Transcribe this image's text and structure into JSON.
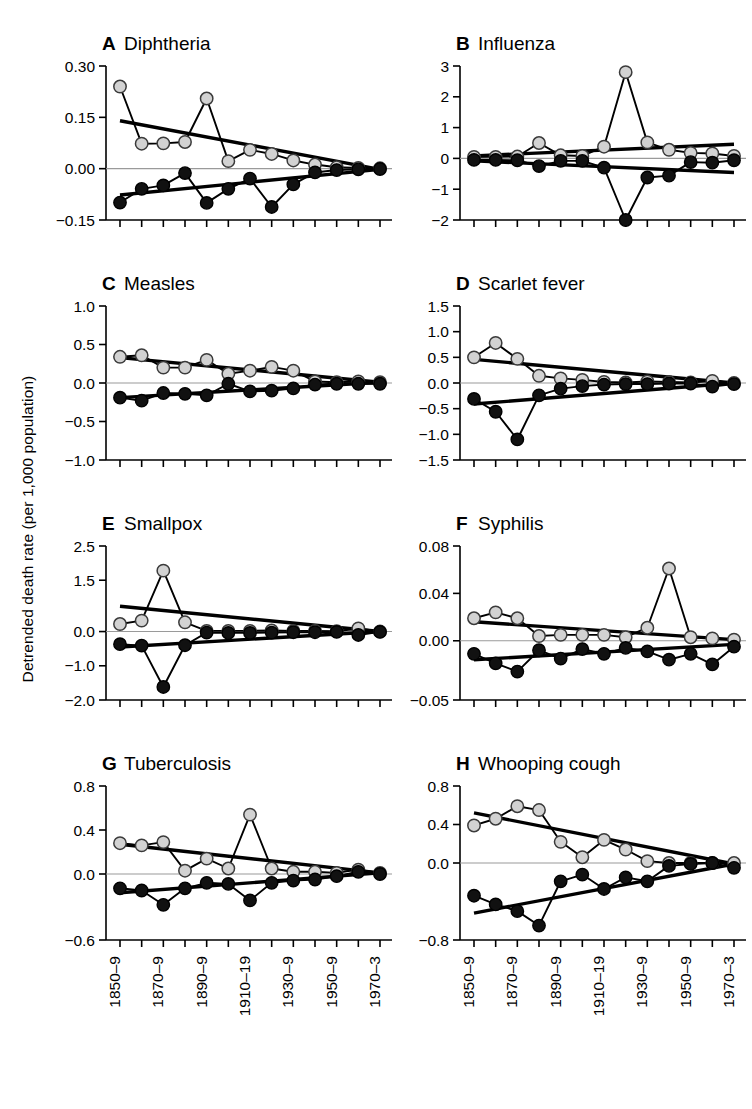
{
  "figure": {
    "y_axis_title": "Detrended death rate (per 1,000 population)",
    "x_tick_labels": [
      "1850–9",
      "1870–9",
      "1890–9",
      "1910–19",
      "1930–9",
      "1950–9",
      "1970–3"
    ],
    "colors": {
      "light_marker": "#d2d2d2",
      "dark_marker": "#111111",
      "line": "#000000",
      "zero_line": "#9a9a9a"
    },
    "n_points": 13,
    "series_names": [
      "upper",
      "lower"
    ]
  },
  "chart_data": [
    {
      "type": "line",
      "panel": "A",
      "title": "Diphtheria",
      "xlabel": "",
      "ylabel": "Detrended death rate (per 1,000 population)",
      "ylim": [
        -0.15,
        0.3
      ],
      "yticks": [
        0.3,
        0.15,
        0.0,
        -0.15
      ],
      "ytick_labels": [
        "0.30",
        "0.15",
        "0.00",
        "-0.15"
      ],
      "grid": false,
      "legend": "none",
      "x": [
        "1850–9",
        "1860–9",
        "1870–9",
        "1880–9",
        "1890–9",
        "1900–9",
        "1910–19",
        "1920–9",
        "1930–9",
        "1940–9",
        "1950–9",
        "1960–9",
        "1970–3"
      ],
      "series": [
        {
          "name": "upper",
          "marker": "light",
          "values": [
            0.24,
            0.073,
            0.074,
            0.078,
            0.205,
            0.022,
            0.055,
            0.043,
            0.024,
            0.012,
            0.004,
            0.002,
            0.001
          ]
        },
        {
          "name": "lower",
          "marker": "dark",
          "values": [
            -0.099,
            -0.059,
            -0.049,
            -0.013,
            -0.1,
            -0.059,
            -0.029,
            -0.112,
            -0.046,
            -0.011,
            -0.004,
            -0.002,
            -0.001
          ]
        }
      ],
      "trends": [
        {
          "name": "upper_trend",
          "y_start": 0.14,
          "y_end": -0.002
        },
        {
          "name": "lower_trend",
          "y_start": -0.077,
          "y_end": -0.002
        }
      ]
    },
    {
      "type": "line",
      "panel": "B",
      "title": "Influenza",
      "xlabel": "",
      "ylabel": "",
      "ylim": [
        -2,
        3
      ],
      "yticks": [
        3,
        2,
        1,
        0,
        -1,
        -2
      ],
      "ytick_labels": [
        "3",
        "2",
        "1",
        "0",
        "-1",
        "-2"
      ],
      "grid": false,
      "legend": "none",
      "x": [
        "1850–9",
        "1860–9",
        "1870–9",
        "1880–9",
        "1890–9",
        "1900–9",
        "1910–19",
        "1920–9",
        "1930–9",
        "1940–9",
        "1950–9",
        "1960–9",
        "1970–3"
      ],
      "series": [
        {
          "name": "upper",
          "marker": "light",
          "values": [
            0.05,
            0.05,
            0.06,
            0.5,
            0.1,
            0.08,
            0.38,
            2.8,
            0.52,
            0.28,
            0.18,
            0.16,
            0.08
          ]
        },
        {
          "name": "lower",
          "marker": "dark",
          "values": [
            -0.05,
            -0.05,
            -0.06,
            -0.25,
            -0.08,
            -0.08,
            -0.3,
            -2.0,
            -0.62,
            -0.56,
            -0.12,
            -0.14,
            -0.06
          ]
        }
      ],
      "trends": [
        {
          "name": "upper_trend",
          "y_start": 0.08,
          "y_end": 0.46
        },
        {
          "name": "lower_trend",
          "y_start": -0.08,
          "y_end": -0.46
        }
      ]
    },
    {
      "type": "line",
      "panel": "C",
      "title": "Measles",
      "xlabel": "",
      "ylabel": "",
      "ylim": [
        -1.0,
        1.0
      ],
      "yticks": [
        1.0,
        0.5,
        0.0,
        -0.5,
        -1.0
      ],
      "ytick_labels": [
        "1.0",
        "0.5",
        "0.0",
        "-0.5",
        "-1.0"
      ],
      "grid": false,
      "legend": "none",
      "x": [
        "1850–9",
        "1860–9",
        "1870–9",
        "1880–9",
        "1890–9",
        "1900–9",
        "1910–19",
        "1920–9",
        "1930–9",
        "1940–9",
        "1950–9",
        "1960–9",
        "1970–3"
      ],
      "series": [
        {
          "name": "upper",
          "marker": "light",
          "values": [
            0.34,
            0.36,
            0.2,
            0.2,
            0.3,
            0.12,
            0.16,
            0.21,
            0.16,
            0.02,
            0.01,
            0.02,
            0.01
          ]
        },
        {
          "name": "lower",
          "marker": "dark",
          "values": [
            -0.19,
            -0.23,
            -0.13,
            -0.14,
            -0.16,
            -0.01,
            -0.11,
            -0.1,
            -0.07,
            -0.02,
            -0.01,
            -0.01,
            -0.01
          ]
        }
      ],
      "trends": [
        {
          "name": "upper_trend",
          "y_start": 0.33,
          "y_end": 0.01
        },
        {
          "name": "lower_trend",
          "y_start": -0.19,
          "y_end": 0.01
        }
      ]
    },
    {
      "type": "line",
      "panel": "D",
      "title": "Scarlet fever",
      "xlabel": "",
      "ylabel": "",
      "ylim": [
        -1.5,
        1.5
      ],
      "yticks": [
        1.5,
        1.0,
        0.5,
        0.0,
        -0.5,
        -1.0,
        -1.5
      ],
      "ytick_labels": [
        "1.5",
        "1.0",
        "0.5",
        "0.0",
        "-0.5",
        "-1.0",
        "-1.5"
      ],
      "grid": false,
      "legend": "none",
      "x": [
        "1850–9",
        "1860–9",
        "1870–9",
        "1880–9",
        "1890–9",
        "1900–9",
        "1910–19",
        "1920–9",
        "1930–9",
        "1940–9",
        "1950–9",
        "1960–9",
        "1970–3"
      ],
      "series": [
        {
          "name": "upper",
          "marker": "light",
          "values": [
            0.5,
            0.78,
            0.47,
            0.14,
            0.09,
            0.06,
            0.02,
            0.01,
            0.03,
            0.02,
            0.01,
            0.04,
            0.0
          ]
        },
        {
          "name": "lower",
          "marker": "dark",
          "values": [
            -0.31,
            -0.56,
            -1.1,
            -0.24,
            -0.11,
            -0.06,
            -0.03,
            -0.02,
            -0.02,
            -0.01,
            -0.01,
            -0.07,
            -0.02
          ]
        }
      ],
      "trends": [
        {
          "name": "upper_trend",
          "y_start": 0.46,
          "y_end": 0.0
        },
        {
          "name": "lower_trend",
          "y_start": -0.41,
          "y_end": 0.0
        }
      ]
    },
    {
      "type": "line",
      "panel": "E",
      "title": "Smallpox",
      "xlabel": "",
      "ylabel": "",
      "ylim": [
        -2.0,
        2.5
      ],
      "yticks": [
        2.5,
        1.5,
        0.0,
        -1.0,
        -2.0
      ],
      "ytick_labels": [
        "2.5",
        "1.5",
        "0.0",
        "-1.0",
        "-2.0"
      ],
      "grid": false,
      "legend": "none",
      "x": [
        "1850–9",
        "1860–9",
        "1870–9",
        "1880–9",
        "1890–9",
        "1900–9",
        "1910–19",
        "1920–9",
        "1930–9",
        "1940–9",
        "1950–9",
        "1960–9",
        "1970–3"
      ],
      "series": [
        {
          "name": "upper",
          "marker": "light",
          "values": [
            0.22,
            0.32,
            1.78,
            0.27,
            0.02,
            0.02,
            0.02,
            0.03,
            0.02,
            0.02,
            0.01,
            0.09,
            0.0
          ]
        },
        {
          "name": "lower",
          "marker": "dark",
          "values": [
            -0.37,
            -0.41,
            -1.62,
            -0.4,
            -0.03,
            -0.04,
            -0.04,
            -0.03,
            -0.02,
            -0.02,
            -0.01,
            -0.1,
            -0.01
          ]
        }
      ],
      "trends": [
        {
          "name": "upper_trend",
          "y_start": 0.74,
          "y_end": 0.0
        },
        {
          "name": "lower_trend",
          "y_start": -0.45,
          "y_end": 0.0
        }
      ]
    },
    {
      "type": "line",
      "panel": "F",
      "title": "Syphilis",
      "xlabel": "",
      "ylabel": "",
      "ylim": [
        -0.05,
        0.08
      ],
      "yticks": [
        0.08,
        0.04,
        0.0,
        -0.05
      ],
      "ytick_labels": [
        "0.08",
        "0.04",
        "0.00",
        "-0.05"
      ],
      "grid": false,
      "legend": "none",
      "x": [
        "1850–9",
        "1860–9",
        "1870–9",
        "1880–9",
        "1890–9",
        "1900–9",
        "1910–19",
        "1920–9",
        "1930–9",
        "1940–9",
        "1950–9",
        "1960–9",
        "1970–3"
      ],
      "series": [
        {
          "name": "upper",
          "marker": "light",
          "values": [
            0.019,
            0.024,
            0.019,
            0.004,
            0.005,
            0.005,
            0.005,
            0.003,
            0.011,
            0.061,
            0.003,
            0.002,
            0.001
          ]
        },
        {
          "name": "lower",
          "marker": "dark",
          "values": [
            -0.011,
            -0.019,
            -0.026,
            -0.008,
            -0.015,
            -0.007,
            -0.011,
            -0.006,
            -0.009,
            -0.016,
            -0.011,
            -0.02,
            -0.005
          ]
        }
      ],
      "trends": [
        {
          "name": "upper_trend",
          "y_start": 0.016,
          "y_end": 0.001
        },
        {
          "name": "lower_trend",
          "y_start": -0.016,
          "y_end": -0.003
        }
      ]
    },
    {
      "type": "line",
      "panel": "G",
      "title": "Tuberculosis",
      "xlabel": "",
      "ylabel": "",
      "ylim": [
        -0.6,
        0.8
      ],
      "yticks": [
        0.8,
        0.4,
        0.0,
        -0.6
      ],
      "ytick_labels": [
        "0.8",
        "0.4",
        "0.0",
        "-0.6"
      ],
      "grid": false,
      "legend": "none",
      "x": [
        "1850–9",
        "1860–9",
        "1870–9",
        "1880–9",
        "1890–9",
        "1900–9",
        "1910–19",
        "1920–9",
        "1930–9",
        "1940–9",
        "1950–9",
        "1960–9",
        "1970–3"
      ],
      "series": [
        {
          "name": "upper",
          "marker": "light",
          "values": [
            0.28,
            0.26,
            0.29,
            0.03,
            0.14,
            0.05,
            0.54,
            0.05,
            0.02,
            0.02,
            0.01,
            0.04,
            0.01
          ]
        },
        {
          "name": "lower",
          "marker": "dark",
          "values": [
            -0.13,
            -0.15,
            -0.28,
            -0.13,
            -0.08,
            -0.09,
            -0.24,
            -0.08,
            -0.06,
            -0.05,
            -0.02,
            0.02,
            0.0
          ]
        }
      ],
      "trends": [
        {
          "name": "upper_trend",
          "y_start": 0.27,
          "y_end": 0.01
        },
        {
          "name": "lower_trend",
          "y_start": -0.17,
          "y_end": 0.01
        }
      ]
    },
    {
      "type": "line",
      "panel": "H",
      "title": "Whooping cough",
      "xlabel": "",
      "ylabel": "",
      "ylim": [
        -0.8,
        0.8
      ],
      "yticks": [
        0.8,
        0.4,
        0.0,
        -0.8
      ],
      "ytick_labels": [
        "0.8",
        "0.4",
        "0.0",
        "-0.8"
      ],
      "grid": false,
      "legend": "none",
      "x": [
        "1850–9",
        "1860–9",
        "1870–9",
        "1880–9",
        "1890–9",
        "1900–9",
        "1910–19",
        "1920–9",
        "1930–9",
        "1940–9",
        "1950–9",
        "1960–9",
        "1970–3"
      ],
      "series": [
        {
          "name": "upper",
          "marker": "light",
          "values": [
            0.39,
            0.46,
            0.59,
            0.55,
            0.22,
            0.06,
            0.24,
            0.14,
            0.02,
            0.0,
            0.0,
            0.0,
            0.0
          ]
        },
        {
          "name": "lower",
          "marker": "dark",
          "values": [
            -0.34,
            -0.43,
            -0.5,
            -0.65,
            -0.19,
            -0.12,
            -0.27,
            -0.15,
            -0.19,
            -0.03,
            -0.01,
            0.0,
            -0.05
          ]
        }
      ],
      "trends": [
        {
          "name": "upper_trend",
          "y_start": 0.52,
          "y_end": -0.01
        },
        {
          "name": "lower_trend",
          "y_start": -0.52,
          "y_end": -0.01
        }
      ]
    }
  ]
}
